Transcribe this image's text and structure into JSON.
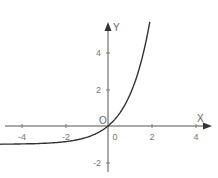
{
  "chart_data": {
    "type": "line",
    "title": "",
    "function_shape": "exponential curve through origin, asymptote y=-1 on the left",
    "xlabel": "X",
    "ylabel": "Y",
    "origin_label": "O",
    "x_ticks": [
      "-4",
      "-2",
      "0",
      "2",
      "4"
    ],
    "y_ticks": [
      "4",
      "2",
      "-2"
    ],
    "xlim": [
      -4.9,
      4.7
    ],
    "ylim": [
      -2.8,
      5.7
    ],
    "grid": false,
    "legend": null,
    "series": [
      {
        "name": "curve",
        "x": [
          -4.9,
          -4,
          -3,
          -2,
          -1,
          -0.5,
          0,
          0.5,
          1,
          1.5,
          1.8,
          1.9
        ],
        "y": [
          -0.99,
          -0.98,
          -0.95,
          -0.86,
          -0.63,
          -0.39,
          0,
          0.65,
          1.72,
          3.48,
          5.05,
          5.69
        ]
      }
    ],
    "colors": {
      "curve": "#333333",
      "axis": "#555555",
      "text": "#777777"
    }
  }
}
